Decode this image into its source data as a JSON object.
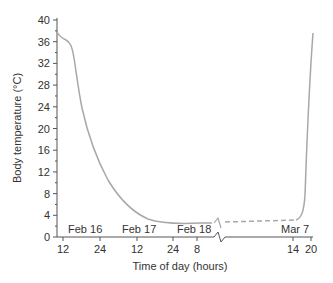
{
  "chart_data": {
    "type": "line",
    "title": "",
    "xlabel": "Time of day (hours)",
    "ylabel": "Body temperature (°C)",
    "ylim": [
      0,
      40
    ],
    "yticks": [
      0,
      4,
      8,
      12,
      16,
      20,
      24,
      28,
      32,
      36,
      40
    ],
    "grid": false,
    "legend": null,
    "x_tick_labels": [
      "12",
      "24",
      "12",
      "24",
      "8",
      "14",
      "20"
    ],
    "date_labels": [
      "Feb 16",
      "Feb 17",
      "Feb 18",
      "Mar 7"
    ],
    "axis_break": "between Feb 18 8h and Mar 7 14h",
    "series": [
      {
        "name": "Body temperature (solid, measured)",
        "style": "solid",
        "points": [
          {
            "x": "Feb 16 09h",
            "y": 37.5
          },
          {
            "x": "Feb 16 12h",
            "y": 36.2
          },
          {
            "x": "Feb 16 14h",
            "y": 33
          },
          {
            "x": "Feb 16 16h",
            "y": 25
          },
          {
            "x": "Feb 16 20h",
            "y": 19
          },
          {
            "x": "Feb 17 00h",
            "y": 13
          },
          {
            "x": "Feb 17 06h",
            "y": 6.8
          },
          {
            "x": "Feb 17 12h",
            "y": 3.5
          },
          {
            "x": "Feb 18 00h",
            "y": 2.6
          },
          {
            "x": "Feb 18 08h",
            "y": 2.5
          }
        ]
      },
      {
        "name": "Body temperature (dashed, interpolated)",
        "style": "dashed",
        "points": [
          {
            "x": "Feb 18 08h",
            "y": 2.5
          },
          {
            "x": "Mar 7 14h",
            "y": 3.0
          }
        ]
      },
      {
        "name": "Rewarming (solid)",
        "style": "solid",
        "points": [
          {
            "x": "Mar 7 14h",
            "y": 3.0
          },
          {
            "x": "Mar 7 16h",
            "y": 8
          },
          {
            "x": "Mar 7 18h",
            "y": 25
          },
          {
            "x": "Mar 7 20h",
            "y": 37
          }
        ]
      }
    ]
  },
  "labels": {
    "ylabel": "Body temperature (°C)",
    "xlabel": "Time of day (hours)",
    "y": [
      "0",
      "4",
      "8",
      "12",
      "16",
      "20",
      "24",
      "28",
      "32",
      "36",
      "40"
    ],
    "x": [
      "12",
      "24",
      "12",
      "24",
      "8",
      "14",
      "20"
    ],
    "dates": [
      "Feb 16",
      "Feb 17",
      "Feb 18",
      "Mar 7"
    ]
  },
  "colors": {
    "curve": "#a8a8a8",
    "axis": "#444444",
    "text": "#333333"
  }
}
